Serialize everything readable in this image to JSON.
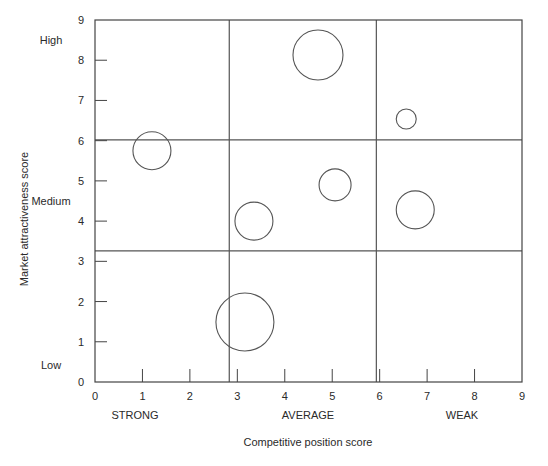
{
  "chart_data": {
    "type": "scatter",
    "subtype": "bubble",
    "title": "",
    "xlabel": "Competitive position score",
    "ylabel": "Market attractiveness score",
    "xlim": [
      0,
      9
    ],
    "ylim": [
      0,
      9
    ],
    "x_ticks": [
      0,
      1,
      2,
      3,
      4,
      5,
      6,
      7,
      8,
      9
    ],
    "y_ticks": [
      0,
      1,
      2,
      3,
      4,
      5,
      6,
      7,
      8,
      9
    ],
    "grid": false,
    "legend": null,
    "x_bands": [
      {
        "label": "STRONG",
        "from": 0,
        "to": 2.83
      },
      {
        "label": "AVERAGE",
        "from": 2.83,
        "to": 5.93
      },
      {
        "label": "WEAK",
        "from": 5.93,
        "to": 9
      }
    ],
    "y_bands": [
      {
        "label": "Low",
        "from": 0,
        "to": 3.26
      },
      {
        "label": "Medium",
        "from": 3.26,
        "to": 6.02
      },
      {
        "label": "High",
        "from": 6.02,
        "to": 9
      }
    ],
    "dividers": {
      "vertical": [
        2.83,
        5.93
      ],
      "horizontal": [
        3.26,
        6.02
      ]
    },
    "points": [
      {
        "x": 4.7,
        "y": 8.13,
        "r": 25
      },
      {
        "x": 6.56,
        "y": 6.54,
        "r": 10
      },
      {
        "x": 1.2,
        "y": 5.75,
        "r": 19
      },
      {
        "x": 5.06,
        "y": 4.9,
        "r": 16
      },
      {
        "x": 3.35,
        "y": 4.0,
        "r": 19
      },
      {
        "x": 6.75,
        "y": 4.28,
        "r": 19
      },
      {
        "x": 3.16,
        "y": 1.49,
        "r": 29
      }
    ]
  },
  "colors": {
    "axis": "#444444",
    "divider": "#555555",
    "bubble_stroke": "#555555",
    "bubble_fill": "#ffffff",
    "text": "#2a2a2a"
  }
}
